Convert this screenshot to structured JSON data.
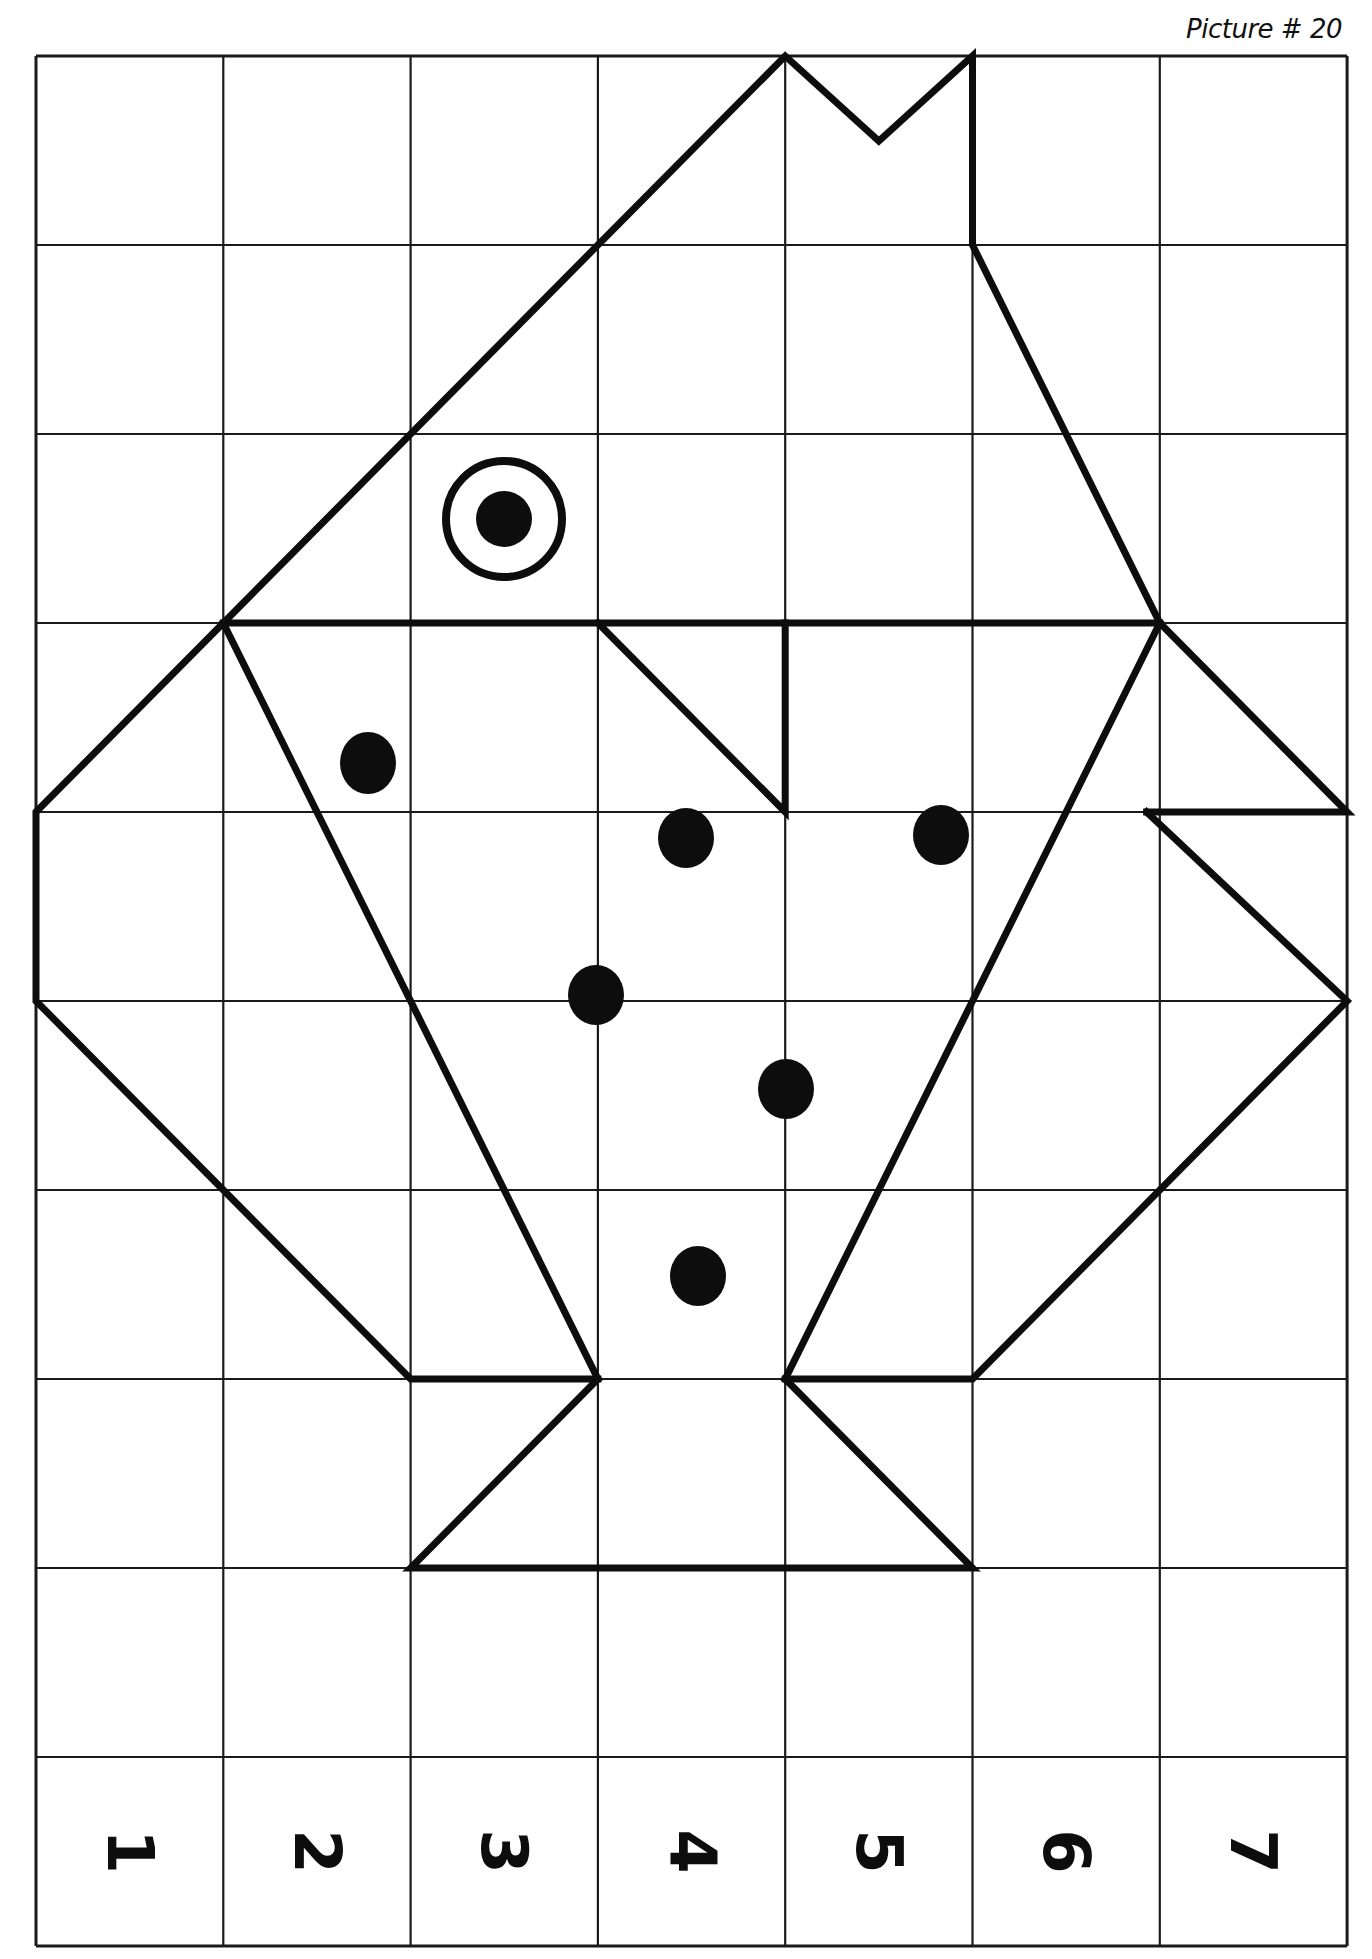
{
  "header": {
    "title": "Picture # 20"
  },
  "grid": {
    "left": 36,
    "top": 56,
    "cell_w": 187.3,
    "cell_h": 189,
    "cols": 7,
    "rows": 10
  },
  "column_labels": [
    "1",
    "2",
    "3",
    "4",
    "5",
    "6",
    "7"
  ],
  "column_label_rotation_deg": 90,
  "figure": {
    "stroke_color": "#0d0d0d",
    "polylines": [
      {
        "name": "crown-and-head",
        "points": [
          [
            1,
            3
          ],
          [
            4,
            0
          ],
          [
            4.5,
            0.45
          ],
          [
            5,
            0
          ],
          [
            5,
            1
          ],
          [
            6,
            3
          ]
        ]
      },
      {
        "name": "head-base-line",
        "points": [
          [
            1,
            3
          ],
          [
            6,
            3
          ]
        ]
      },
      {
        "name": "left-wing",
        "points": [
          [
            1,
            3
          ],
          [
            0,
            4
          ],
          [
            0,
            5
          ],
          [
            1,
            6
          ],
          [
            2,
            7
          ],
          [
            3,
            7
          ]
        ]
      },
      {
        "name": "left-body-edge",
        "points": [
          [
            1,
            3
          ],
          [
            3,
            7
          ]
        ]
      },
      {
        "name": "right-body-edge",
        "points": [
          [
            6,
            3
          ],
          [
            4,
            7
          ]
        ]
      },
      {
        "name": "right-wing-upper",
        "points": [
          [
            6,
            3
          ],
          [
            7,
            4
          ],
          [
            5.93,
            4
          ]
        ]
      },
      {
        "name": "right-wing-lower",
        "points": [
          [
            5.93,
            4
          ],
          [
            7,
            5
          ],
          [
            5,
            7
          ],
          [
            4,
            7
          ]
        ]
      },
      {
        "name": "beak",
        "points": [
          [
            3,
            3
          ],
          [
            4,
            4
          ],
          [
            4,
            3
          ]
        ]
      },
      {
        "name": "feet",
        "points": [
          [
            3,
            7
          ],
          [
            2,
            8
          ],
          [
            5,
            8
          ],
          [
            4,
            7
          ]
        ]
      }
    ],
    "eye": {
      "cx": 504,
      "cy": 519,
      "ring_r": 58,
      "pupil_r": 28
    },
    "dots": [
      {
        "cx": 368,
        "cy": 763,
        "rx": 28,
        "ry": 31
      },
      {
        "cx": 686,
        "cy": 838,
        "rx": 28,
        "ry": 30
      },
      {
        "cx": 941,
        "cy": 835,
        "rx": 28,
        "ry": 30
      },
      {
        "cx": 596,
        "cy": 995,
        "rx": 28,
        "ry": 30
      },
      {
        "cx": 786,
        "cy": 1089,
        "rx": 28,
        "ry": 30
      },
      {
        "cx": 698,
        "cy": 1276,
        "rx": 28,
        "ry": 30
      }
    ]
  }
}
